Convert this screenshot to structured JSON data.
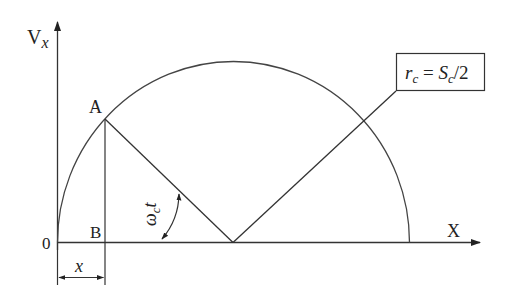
{
  "diagram": {
    "colors": {
      "stroke": "#333333",
      "text": "#222222",
      "background": "#ffffff"
    },
    "axes": {
      "y_label_main": "V",
      "y_label_sub": "x",
      "x_label": "X",
      "origin_label": "0"
    },
    "points": {
      "A": "A",
      "B": "B"
    },
    "dimension": {
      "label": "x"
    },
    "angle": {
      "label_main": "ω",
      "label_sub": "c",
      "label_var": "t"
    },
    "callout": {
      "r": "r",
      "r_sub": "c",
      "equals": " = ",
      "S": "S",
      "S_sub": "c",
      "rest": "/2"
    }
  }
}
